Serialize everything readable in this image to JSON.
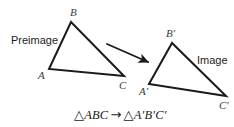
{
  "figure": {
    "type": "geometry-diagram",
    "background_color": "#ffffff",
    "stroke_color": "#1a1a1a",
    "stroke_width": 2,
    "width": 234,
    "height": 127
  },
  "labels": {
    "preimage": "Preimage",
    "image": "Image"
  },
  "preimage_triangle": {
    "name": "triangle-ABC",
    "vertices": [
      {
        "name": "A",
        "label": "A",
        "x": 49,
        "y": 69,
        "label_x": 38,
        "label_y": 70
      },
      {
        "name": "B",
        "label": "B",
        "x": 71,
        "y": 22,
        "label_x": 70,
        "label_y": 7
      },
      {
        "name": "C",
        "label": "C",
        "x": 124,
        "y": 76,
        "label_x": 119,
        "label_y": 80
      }
    ]
  },
  "image_triangle": {
    "name": "triangle-A-prime-B-prime-C-prime",
    "vertices": [
      {
        "name": "A-prime",
        "label": "A′",
        "x": 149,
        "y": 84,
        "label_x": 139,
        "label_y": 86
      },
      {
        "name": "B-prime",
        "label": "B′",
        "x": 172,
        "y": 43,
        "label_x": 166,
        "label_y": 28
      },
      {
        "name": "C-prime",
        "label": "C′",
        "x": 226,
        "y": 96,
        "label_x": 219,
        "label_y": 100
      }
    ]
  },
  "transform_arrow": {
    "name": "transformation-arrow",
    "x1": 107,
    "y1": 44,
    "x2": 148,
    "y2": 62
  },
  "equation": {
    "full": "△ABC → △A′B′C′",
    "left_triangle_symbol": "△",
    "left_vertices": "ABC",
    "arrow": "→",
    "right_triangle_symbol": "△",
    "right_vertices": "A′B′C′",
    "x": 74,
    "y": 108
  }
}
